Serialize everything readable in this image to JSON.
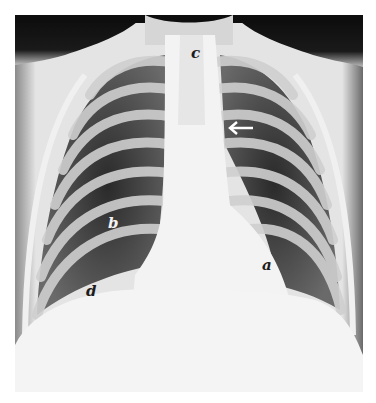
{
  "figure": {
    "type": "chest radiograph (posteroanterior view)",
    "labels": [
      {
        "id": "a",
        "text": "a",
        "x": 262,
        "y": 258,
        "tone": "dark"
      },
      {
        "id": "b",
        "text": "b",
        "x": 108,
        "y": 216,
        "tone": "light"
      },
      {
        "id": "c",
        "text": "c",
        "x": 191,
        "y": 46,
        "tone": "dark"
      },
      {
        "id": "d",
        "text": "d",
        "x": 86,
        "y": 284,
        "tone": "dark"
      }
    ],
    "arrow": {
      "direction": "left",
      "x": 229,
      "y": 124,
      "color": "#ffffff"
    }
  },
  "colors": {
    "background": "#ffffff",
    "film_dark": "#101010",
    "lung_field": "#3a3a3a",
    "bone": "#d8d8d8",
    "soft_tissue": "#f2f2f2"
  }
}
